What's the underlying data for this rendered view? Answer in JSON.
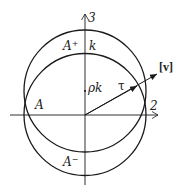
{
  "figure": {
    "axes": {
      "vertical_label": "3",
      "horizontal_label": "2"
    },
    "circles": [
      {
        "name": "upper-circle",
        "cx": 85,
        "cy": 91,
        "r": 61
      },
      {
        "name": "lower-circle",
        "cx": 85,
        "cy": 114.5,
        "r": 61
      }
    ],
    "labels": {
      "a_plus": "A",
      "a_plus_sup": "+",
      "a_minus": "A",
      "a_minus_sup": "−",
      "a_left": "A",
      "k": "k",
      "rho_k": "ρk",
      "tau": "τ",
      "v_bracket": "[v]"
    },
    "colors": {
      "stroke": "#1a1a1a",
      "background": "#ffffff"
    }
  }
}
